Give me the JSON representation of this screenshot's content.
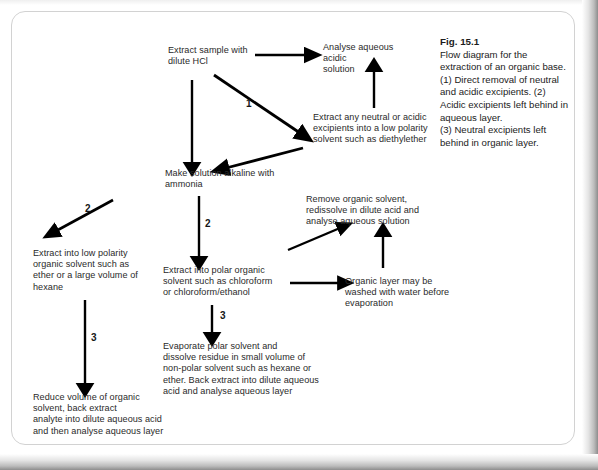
{
  "figure": {
    "caption_title": "Fig. 15.1",
    "caption_body": "Flow diagram for the extraction of an organic base. (1) Direct removal of neutral and acidic excipients. (2) Acidic excipients left behind in aqueous layer.\n(3) Neutral excipients left behind in organic layer."
  },
  "nodes": {
    "extract_sample": "Extract sample with\ndilute HCl",
    "analyse_aqueous_acidic": "Analyse aqueous\nacidic\nsolution",
    "extract_neutral_acidic": "Extract any neutral or acidic\nexcipients into a low polarity\nsolvent such as diethylether",
    "make_alkaline": "Make solution alkaline with\nammonia",
    "remove_organic_solvent": "Remove organic solvent,\nredissolve in dilute acid and\nanalyse aqueous solution",
    "extract_low_polarity": "Extract into low polarity\norganic solvent such as\nether or a large volume of\nhexane",
    "extract_polar_organic": "Extract into polar organic\nsolvent such as chloroform\nor chloroform/ethanol",
    "organic_layer_washed": "Organic layer may be\nwashed with water before\nevaporation",
    "evaporate_polar_solvent": "Evaporate polar solvent and\ndissolve residue in small volume of\nnon-polar solvent such as hexane or\nether. Back extract into dilute aqueous\nacid and analyse aqueous layer",
    "reduce_volume": "Reduce volume of organic\nsolvent, back extract\nanalyte into dilute aqueous acid\nand then analyse aqueous layer"
  },
  "labels": {
    "route_1": "1",
    "route_2_left": "2",
    "route_2_middle": "2",
    "route_3_left": "3",
    "route_3_middle": "3"
  },
  "colors": {
    "ink": "#2a2a2a",
    "arrow": "#000000",
    "frame": "#d2d2d2",
    "page_background": "#ffffff"
  }
}
